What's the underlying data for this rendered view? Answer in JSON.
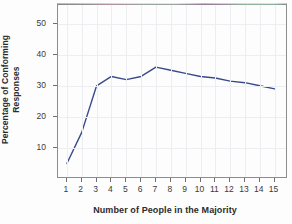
{
  "chart_data": {
    "type": "line",
    "title": "",
    "subtitle": "",
    "xlabel": "Number of People in the Majority",
    "ylabel": "Percentage of Conforming Responses",
    "ylabel_line1": "Percentage of Conforming",
    "ylabel_line2": "Responses",
    "x": [
      1,
      2,
      3,
      4,
      5,
      6,
      7,
      8,
      9,
      10,
      11,
      12,
      13,
      14,
      15
    ],
    "values": [
      5,
      15,
      30,
      33,
      32,
      33,
      36,
      35,
      34,
      33,
      32.5,
      31.5,
      31,
      30,
      29
    ],
    "xtick_labels": [
      "1",
      "2",
      "3",
      "4",
      "5",
      "6",
      "7",
      "8",
      "9",
      "10",
      "11",
      "12",
      "13",
      "14",
      "15"
    ],
    "ytick_labels": [
      "10",
      "20",
      "30",
      "40",
      "50"
    ],
    "ytick_values": [
      10,
      20,
      30,
      40,
      50
    ],
    "xlim": [
      0.4,
      15.9
    ],
    "ylim": [
      0,
      56
    ],
    "grid": true,
    "grid_axis": "both",
    "legend": "none",
    "series": [
      {
        "name": "Percentage of Conforming Responses",
        "color": "#3b4a8c",
        "values": [
          5,
          15,
          30,
          33,
          32,
          33,
          36,
          35,
          34,
          33,
          32.5,
          31.5,
          31,
          30,
          29
        ]
      }
    ]
  },
  "colors": {
    "line": "#3b4a8c",
    "frame": "#8c8c8c",
    "grid": "#eceef1",
    "tick": "#6f6f6f",
    "text": "#2b2b2b",
    "background": "#fdfdfd"
  }
}
